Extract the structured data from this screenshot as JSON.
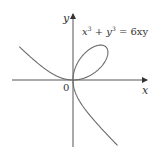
{
  "chart_data": {
    "type": "line",
    "equation": "x^3 + y^3 = 6xy",
    "curve_name": "folium of Descartes",
    "parametric": {
      "x": "6t/(1+t^3)",
      "y": "6t^2/(1+t^3)"
    },
    "asymptote": "x + y = -2",
    "loop_tip": [
      3,
      3
    ],
    "xlabel": "x",
    "ylabel": "y",
    "origin_label": "0",
    "xlim": [
      -5.6,
      6.7
    ],
    "ylim": [
      -6.0,
      6.0
    ],
    "grid": false,
    "legend": "none",
    "branches": [
      {
        "name": "upper-left branch",
        "from": [
          -5.2,
          3.2
        ],
        "to": [
          0,
          0
        ]
      },
      {
        "name": "loop",
        "from": [
          0,
          0
        ],
        "through": [
          3,
          3
        ],
        "to": [
          0,
          0
        ]
      },
      {
        "name": "lower-right branch",
        "from": [
          0,
          0
        ],
        "to": [
          4.3,
          -5.9
        ]
      }
    ]
  },
  "labels": {
    "equation_x": "x",
    "equation_sup1": "3",
    "equation_plus": " + ",
    "equation_y": "y",
    "equation_sup2": "3",
    "equation_rhs": " = 6xy",
    "x_axis": "x",
    "y_axis": "y",
    "origin": "0"
  },
  "colors": {
    "axis": "#555555",
    "curve": "#6b6b6b",
    "text": "#333333"
  }
}
